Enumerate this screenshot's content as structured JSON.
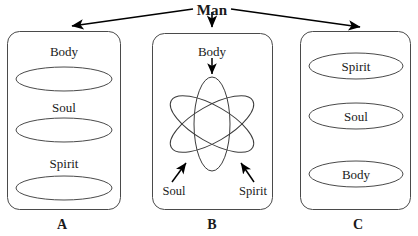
{
  "diagram": {
    "title": "Man",
    "panels": [
      {
        "id": "A",
        "letter": "A",
        "layout": "labels-above-ellipses",
        "items": [
          {
            "label": "Body"
          },
          {
            "label": "Soul"
          },
          {
            "label": "Spirit"
          }
        ]
      },
      {
        "id": "B",
        "letter": "B",
        "layout": "interlocking-orbits",
        "items": [
          {
            "label": "Body"
          },
          {
            "label": "Soul"
          },
          {
            "label": "Spirit"
          }
        ]
      },
      {
        "id": "C",
        "letter": "C",
        "layout": "labels-inside-ellipses",
        "items": [
          {
            "label": "Spirit"
          },
          {
            "label": "Soul"
          },
          {
            "label": "Body"
          }
        ]
      }
    ],
    "colors": {
      "stroke": "#4a4a4a",
      "arrow": "#000000",
      "text": "#1a1a1a",
      "background": "#ffffff"
    }
  }
}
